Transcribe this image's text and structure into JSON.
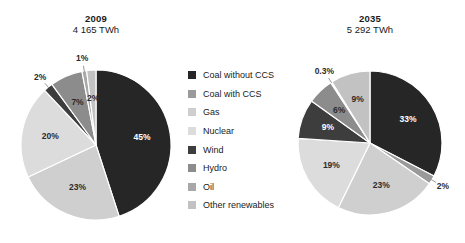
{
  "figure": {
    "background": "#ffffff",
    "label_dark_text": "#ffffff",
    "label_light_text": "#2b2b2b"
  },
  "panels": [
    {
      "id": "2009",
      "title": "2009",
      "subtitle": "4 165 TWh"
    },
    {
      "id": "2035",
      "title": "2035",
      "subtitle": "5 292 TWh"
    }
  ],
  "legend": {
    "position": "center",
    "items": [
      {
        "label": "Coal without CCS",
        "color": "#262626"
      },
      {
        "label": "Coal with CCS",
        "color": "#9a9a9a"
      },
      {
        "label": "Gas",
        "color": "#cfcfcf"
      },
      {
        "label": "Nuclear",
        "color": "#dcdcdc"
      },
      {
        "label": "Wind",
        "color": "#3d3d3d"
      },
      {
        "label": "Hydro",
        "color": "#8c8c8c"
      },
      {
        "label": "Oil",
        "color": "#a8a8a8"
      },
      {
        "label": "Other renewables",
        "color": "#c2c2c2"
      }
    ]
  },
  "chart_data": [
    {
      "type": "pie",
      "title": "2009",
      "subtitle": "4 165 TWh",
      "total_label": "4 165 TWh",
      "total_value": 4165,
      "unit": "TWh",
      "start_angle_deg": 0,
      "direction": "clockwise",
      "labels": [
        "Coal without CCS",
        "Gas",
        "Nuclear",
        "Wind",
        "Hydro",
        "Oil",
        "Other renewables"
      ],
      "values": [
        45,
        23,
        20,
        2,
        7,
        1,
        2
      ],
      "display_labels": [
        "45%",
        "23%",
        "20%",
        "2%",
        "7%",
        "1%",
        "2%"
      ],
      "colors": [
        "#262626",
        "#cfcfcf",
        "#dcdcdc",
        "#3d3d3d",
        "#8c8c8c",
        "#a8a8a8",
        "#c2c2c2"
      ],
      "label_placement": [
        "inside",
        "inside",
        "inside",
        "outside",
        "inside",
        "outside",
        "inside"
      ]
    },
    {
      "type": "pie",
      "title": "2035",
      "subtitle": "5 292 TWh",
      "total_label": "5 292 TWh",
      "total_value": 5292,
      "unit": "TWh",
      "start_angle_deg": 0,
      "direction": "clockwise",
      "labels": [
        "Coal without CCS",
        "Coal with CCS",
        "Gas",
        "Nuclear",
        "Wind",
        "Hydro",
        "Oil",
        "Other renewables"
      ],
      "values": [
        33,
        2,
        23,
        19,
        9,
        6,
        0.3,
        9
      ],
      "display_labels": [
        "33%",
        "2%",
        "23%",
        "19%",
        "9%",
        "6%",
        "0.3%",
        "9%"
      ],
      "colors": [
        "#262626",
        "#9a9a9a",
        "#cfcfcf",
        "#dcdcdc",
        "#3d3d3d",
        "#8c8c8c",
        "#a8a8a8",
        "#c2c2c2"
      ],
      "label_placement": [
        "inside",
        "outside",
        "inside",
        "inside",
        "inside",
        "inside",
        "outside",
        "inside"
      ]
    }
  ]
}
